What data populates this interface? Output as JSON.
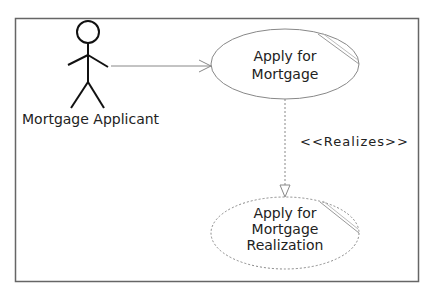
{
  "diagram": {
    "type": "UML use case diagram",
    "actor": {
      "name": "Mortgage Applicant"
    },
    "use_cases": [
      {
        "id": "uc1",
        "label": "Apply for\nMortgage",
        "lines": [
          "Apply for",
          "Mortgage"
        ],
        "style": "solid"
      },
      {
        "id": "uc2",
        "label": "Apply for\nMortgage\nRealization",
        "lines": [
          "Apply for",
          "Mortgage",
          "Realization"
        ],
        "style": "dashed"
      }
    ],
    "relationships": [
      {
        "from": "Mortgage Applicant",
        "to": "uc1",
        "type": "association",
        "arrow": "open"
      },
      {
        "from": "uc1",
        "to": "uc2",
        "type": "realization",
        "stereotype": "<<Realizes>>"
      }
    ],
    "colors": {
      "line": "#777777",
      "actor": "#111111",
      "text": "#222222",
      "frame": "#666666"
    }
  }
}
